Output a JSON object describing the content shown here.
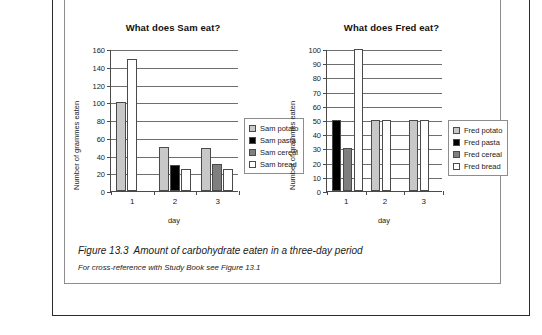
{
  "figure": {
    "caption_label": "Figure 13.3",
    "caption_text": "Amount of carbohydrate eaten in a three-day period",
    "cross_reference": "For cross-reference with Study Book see Figure 13.1"
  },
  "chart_data": [
    {
      "type": "bar",
      "id": "sam",
      "title": "What does Sam eat?",
      "xlabel": "day",
      "ylabel": "Number of grammes eaten",
      "categories": [
        "1",
        "2",
        "3"
      ],
      "ylim": [
        0,
        160
      ],
      "yticks": [
        0,
        20,
        40,
        60,
        80,
        100,
        120,
        140,
        160
      ],
      "grid": true,
      "legend_position": "right",
      "series": [
        {
          "name": "Sam potato",
          "color": "#c8c8c8",
          "key": "potato",
          "values": [
            100,
            50,
            49
          ]
        },
        {
          "name": "Sam pasta",
          "color": "#000000",
          "key": "pasta",
          "values": [
            0,
            29,
            0
          ]
        },
        {
          "name": "Sam cereal",
          "color": "#7f7f7f",
          "key": "cereal",
          "values": [
            0,
            0,
            30
          ]
        },
        {
          "name": "Sam bread",
          "color": "#ffffff",
          "key": "bread",
          "values": [
            149,
            25,
            25
          ]
        }
      ]
    },
    {
      "type": "bar",
      "id": "fred",
      "title": "What does Fred eat?",
      "xlabel": "day",
      "ylabel": "Number of grammes eaten",
      "categories": [
        "1",
        "2",
        "3"
      ],
      "ylim": [
        0,
        100
      ],
      "yticks": [
        0,
        10,
        20,
        30,
        40,
        50,
        60,
        70,
        80,
        90,
        100
      ],
      "grid": true,
      "legend_position": "right",
      "series": [
        {
          "name": "Fred potato",
          "color": "#c8c8c8",
          "key": "potato",
          "values": [
            0,
            50,
            50
          ]
        },
        {
          "name": "Fred pasta",
          "color": "#000000",
          "key": "pasta",
          "values": [
            50,
            0,
            0
          ]
        },
        {
          "name": "Fred cereal",
          "color": "#7f7f7f",
          "key": "cereal",
          "values": [
            30,
            0,
            0
          ]
        },
        {
          "name": "Fred bread",
          "color": "#ffffff",
          "key": "bread",
          "values": [
            100,
            50,
            50
          ]
        }
      ]
    }
  ]
}
